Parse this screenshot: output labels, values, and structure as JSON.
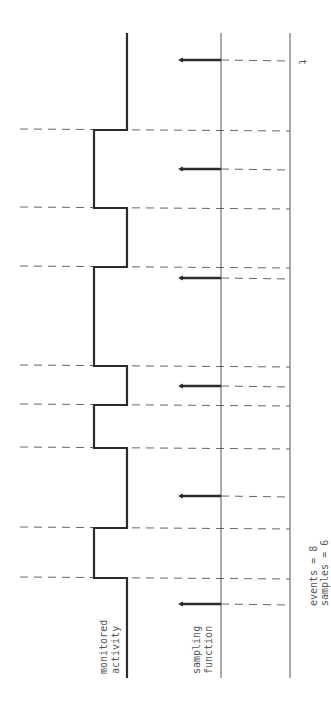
{
  "labels": {
    "monitored_line1": "monitored",
    "monitored_line2": "activity",
    "sampling_line1": "sampling",
    "sampling_line2": "function",
    "time_axis": "t",
    "events": "events = 8",
    "samples": "samples = 6"
  },
  "colors": {
    "ink": "#2b2b2b",
    "thin": "#555555",
    "dash": "#666666"
  },
  "geometry": {
    "activity_low_x": 127,
    "activity_high_x": 94,
    "sampling_axis_x": 221,
    "time_axis_x": 290,
    "top_y": 33,
    "bottom_y": 678,
    "dash_start_x": 20,
    "sample_tip_x": 178
  },
  "activity_high_intervals": [
    [
      130,
      208
    ],
    [
      267,
      366
    ],
    [
      405,
      448
    ],
    [
      528,
      578
    ]
  ],
  "event_edges_y": [
    130,
    208,
    267,
    366,
    405,
    448,
    528,
    578
  ],
  "sample_times_y": [
    60,
    169,
    278,
    386,
    496,
    604
  ],
  "counts": {
    "events": 8,
    "samples": 6
  }
}
